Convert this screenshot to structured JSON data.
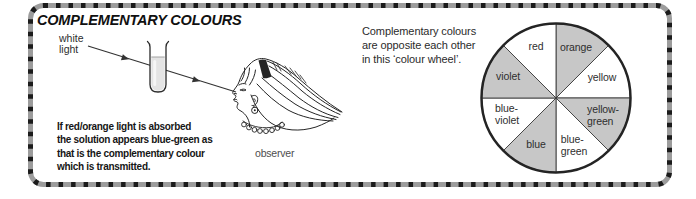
{
  "title": "COMPLEMENTARY COLOURS",
  "diagram": {
    "light_label": "white\nlight",
    "observer_label": "observer",
    "caption": "If red/orange light is absorbed\nthe solution appears blue-green as\nthat is the complementary colour\nwhich is transmitted."
  },
  "wheel": {
    "note": "Complementary colours\nare opposite each other\nin this ‘colour wheel’.",
    "segments": [
      {
        "label": "orange",
        "display": "orange",
        "shaded": true,
        "start": 0,
        "end": 45,
        "opposite": "blue",
        "dx": 20,
        "dy": -50
      },
      {
        "label": "yellow",
        "display": "yellow",
        "shaded": false,
        "start": 45,
        "end": 90,
        "opposite": "blue-violet",
        "dx": 46,
        "dy": -20
      },
      {
        "label": "yellow-green",
        "display": "yellow-\ngreen",
        "shaded": true,
        "start": 90,
        "end": 135,
        "opposite": "violet",
        "dx": 47,
        "dy": 17
      },
      {
        "label": "blue-green",
        "display": "blue-\ngreen",
        "shaded": false,
        "start": 135,
        "end": 180,
        "opposite": "red",
        "dx": 18,
        "dy": 47
      },
      {
        "label": "blue",
        "display": "blue",
        "shaded": true,
        "start": 180,
        "end": 225,
        "opposite": "orange",
        "dx": -20,
        "dy": 47
      },
      {
        "label": "blue-violet",
        "display": "blue-\nviolet",
        "shaded": false,
        "start": 225,
        "end": 270,
        "opposite": "yellow",
        "dx": -49,
        "dy": 16
      },
      {
        "label": "violet",
        "display": "violet",
        "shaded": true,
        "start": 270,
        "end": 315,
        "opposite": "yellow-green",
        "dx": -48,
        "dy": -21
      },
      {
        "label": "red",
        "display": "red",
        "shaded": false,
        "start": 315,
        "end": 360,
        "opposite": "blue-green",
        "dx": -20,
        "dy": -51
      }
    ]
  },
  "colors": {
    "border_band": "#9c9c9c",
    "border_dash": "#1b1b1b",
    "wheel_shade": "#c7c7c7",
    "wheel_line": "#3a3a3a",
    "wheel_rim": "#242424",
    "ink": "#252525",
    "liquid": "#e4e4e4"
  }
}
